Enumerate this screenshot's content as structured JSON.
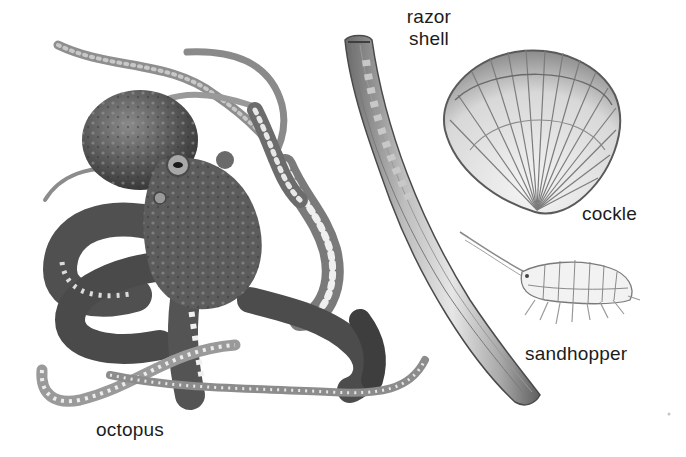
{
  "plate": {
    "background": "#ffffff",
    "ink_color": "#1c1c1c",
    "specimens": [
      {
        "id": "octopus",
        "label": "octopus",
        "illustration": "octopus-illustration"
      },
      {
        "id": "razor_shell",
        "label_lines": [
          "razor",
          "shell"
        ],
        "illustration": "razor-shell-illustration"
      },
      {
        "id": "cockle",
        "label": "cockle",
        "illustration": "cockle-illustration"
      },
      {
        "id": "sandhopper",
        "label": "sandhopper",
        "illustration": "sandhopper-illustration"
      }
    ]
  },
  "labels": {
    "octopus": "octopus",
    "razor_line1": "razor",
    "razor_line2": "shell",
    "cockle": "cockle",
    "sandhopper": "sandhopper"
  }
}
